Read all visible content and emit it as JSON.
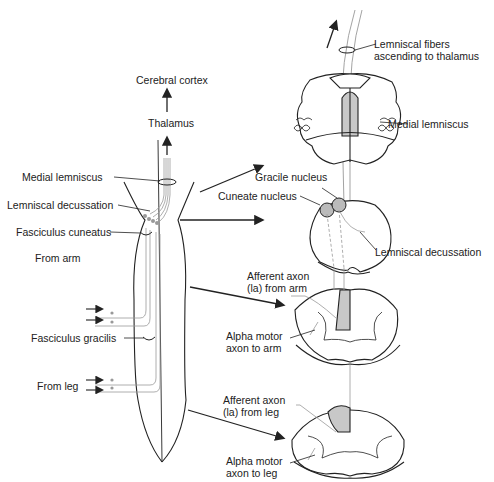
{
  "diagram": {
    "type": "anatomy",
    "colors": {
      "line": "#222222",
      "fiber": "#999999",
      "shade": "#c8c8c8",
      "background": "#ffffff"
    }
  },
  "left_labels": {
    "cerebral_cortex": "Cerebral cortex",
    "thalamus": "Thalamus",
    "medial_lemniscus": "Medial lemniscus",
    "lemniscal_decussation": "Lemniscal decussation",
    "fasciculus_cuneatus": "Fasciculus cuneatus",
    "from_arm": "From arm",
    "fasciculus_gracilis": "Fasciculus gracilis",
    "from_leg": "From leg"
  },
  "right_labels": {
    "lemniscal_fibers": "Lemniscal fibers ascending to thalamus",
    "medial_lemniscus": "Medial lemniscus",
    "gracile_nucleus": "Gracile nucleus",
    "cuneate_nucleus": "Cuneate nucleus",
    "lemniscal_decussation": "Lemniscal decussation",
    "afferent_arm": "Afferent axon (la) from arm",
    "alpha_arm": "Alpha motor axon to arm",
    "afferent_leg": "Afferent axon (la) from leg",
    "alpha_leg": "Alpha motor axon to leg"
  },
  "sections": [
    {
      "id": "midbrain",
      "name": "Upper brainstem section"
    },
    {
      "id": "medulla",
      "name": "Caudal medulla section"
    },
    {
      "id": "cervical",
      "name": "Cervical spinal cord section"
    },
    {
      "id": "lumbar",
      "name": "Lumbar spinal cord section"
    }
  ]
}
